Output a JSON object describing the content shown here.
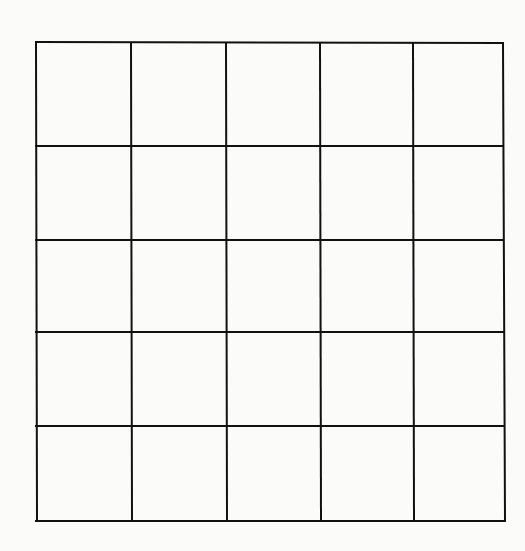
{
  "diagram": {
    "type": "grid",
    "rows": 5,
    "columns": 5,
    "line_color": "#111111",
    "background_color": "#fbfbfa",
    "line_width": 2,
    "column_lines_x": [
      36,
      131,
      226,
      320,
      413,
      503
    ],
    "row_lines_y": [
      43,
      146,
      240,
      332,
      426,
      521
    ],
    "cells_filled": []
  }
}
